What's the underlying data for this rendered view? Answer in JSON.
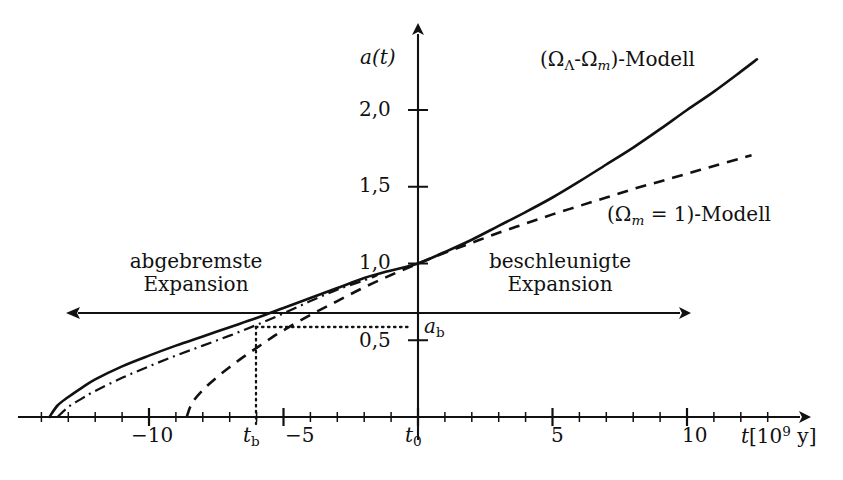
{
  "chart_data": {
    "type": "line",
    "title": "",
    "xlabel": "t[10^9 y]",
    "ylabel": "a(t)",
    "xlim": [
      -14.5,
      13.5
    ],
    "ylim": [
      0,
      2.45
    ],
    "grid": false,
    "legend_position": "inside-right",
    "x_ticks_major": [
      -10,
      -5,
      0,
      5,
      10
    ],
    "x_tick_labels": [
      "-10",
      "-5",
      "t_0",
      "5",
      "10"
    ],
    "x_ticks_minor": [
      -14,
      -13,
      -12,
      -11,
      -9,
      -8,
      -7,
      -6,
      -4,
      -3,
      -2,
      -1,
      1,
      2,
      3,
      4,
      6,
      7,
      8,
      9,
      11,
      12,
      13
    ],
    "y_ticks": [
      0.5,
      1.0,
      1.5,
      2.0
    ],
    "y_tick_labels": [
      "0,5",
      "1,0",
      "1,5",
      "2,0"
    ],
    "series": [
      {
        "name": "(Ω_Λ-Ω_m)-Modell",
        "style": "solid",
        "points": [
          [
            -13.7,
            0.0
          ],
          [
            -13.4,
            0.075
          ],
          [
            -13.0,
            0.13
          ],
          [
            -12.5,
            0.19
          ],
          [
            -12.0,
            0.245
          ],
          [
            -11.0,
            0.33
          ],
          [
            -10.0,
            0.4
          ],
          [
            -9.0,
            0.465
          ],
          [
            -8.0,
            0.525
          ],
          [
            -7.0,
            0.585
          ],
          [
            -6.0,
            0.645
          ],
          [
            -5.0,
            0.71
          ],
          [
            -4.0,
            0.775
          ],
          [
            -3.0,
            0.84
          ],
          [
            -2.0,
            0.905
          ],
          [
            -1.0,
            0.955
          ],
          [
            0.0,
            1.0
          ],
          [
            1.0,
            1.075
          ],
          [
            2.0,
            1.155
          ],
          [
            3.0,
            1.245
          ],
          [
            4.0,
            1.335
          ],
          [
            5.0,
            1.43
          ],
          [
            6.0,
            1.535
          ],
          [
            7.0,
            1.645
          ],
          [
            8.0,
            1.755
          ],
          [
            9.0,
            1.875
          ],
          [
            10.0,
            2.0
          ],
          [
            11.0,
            2.12
          ],
          [
            12.0,
            2.25
          ],
          [
            12.6,
            2.33
          ]
        ]
      },
      {
        "name": "(Ω_m = 1)-Modell",
        "style": "dashed",
        "points": [
          [
            -8.6,
            0.0
          ],
          [
            -8.4,
            0.09
          ],
          [
            -8.0,
            0.175
          ],
          [
            -7.5,
            0.255
          ],
          [
            -7.0,
            0.325
          ],
          [
            -6.5,
            0.39
          ],
          [
            -6.0,
            0.45
          ],
          [
            -5.5,
            0.51
          ],
          [
            -5.0,
            0.565
          ],
          [
            -4.0,
            0.665
          ],
          [
            -3.0,
            0.755
          ],
          [
            -2.0,
            0.845
          ],
          [
            -1.0,
            0.925
          ],
          [
            0.0,
            1.0
          ],
          [
            1.0,
            1.07
          ],
          [
            2.0,
            1.135
          ],
          [
            3.0,
            1.2
          ],
          [
            4.0,
            1.26
          ],
          [
            5.0,
            1.32
          ],
          [
            6.0,
            1.375
          ],
          [
            7.0,
            1.43
          ],
          [
            8.0,
            1.485
          ],
          [
            9.0,
            1.535
          ],
          [
            10.0,
            1.585
          ],
          [
            11.0,
            1.635
          ],
          [
            12.0,
            1.685
          ],
          [
            12.4,
            1.705
          ]
        ]
      },
      {
        "name": "dash-dot-curve",
        "style": "dashdot",
        "points": [
          [
            -13.4,
            0.0
          ],
          [
            -13.0,
            0.065
          ],
          [
            -12.5,
            0.12
          ],
          [
            -12.0,
            0.17
          ],
          [
            -11.0,
            0.255
          ],
          [
            -10.0,
            0.33
          ],
          [
            -9.0,
            0.4
          ],
          [
            -8.0,
            0.465
          ],
          [
            -7.0,
            0.53
          ],
          [
            -6.0,
            0.6
          ],
          [
            -5.0,
            0.675
          ],
          [
            -4.0,
            0.755
          ],
          [
            -3.0,
            0.83
          ],
          [
            -2.0,
            0.89
          ],
          [
            -1.5,
            0.925
          ]
        ]
      }
    ],
    "annotations": {
      "a_b_value": 0.58,
      "t_b_value": -6.4,
      "divider_axis_value": 0.68
    }
  },
  "labels": {
    "y_axis_title": "a(t)",
    "x_axis_title_var": "t",
    "x_axis_title_bracket_open": "[10",
    "x_axis_title_exp": "9",
    "x_axis_title_unit": " y]",
    "y_tick_2_0": "2,0",
    "y_tick_1_5": "1,5",
    "y_tick_1_0": "1,0",
    "y_tick_0_5": "0,5",
    "x_tick_minus10": "−10",
    "x_tick_minus5": "−5",
    "x_tick_tb_var": "t",
    "x_tick_tb_sub": "b",
    "x_tick_t0_var": "t",
    "x_tick_t0_sub": "0",
    "x_tick_5": "5",
    "x_tick_10": "10",
    "a_b_var": "a",
    "a_b_sub": "b",
    "legend_lambda_open": "(Ω",
    "legend_lambda_sub": "Λ",
    "legend_lambda_dash": "-Ω",
    "legend_lambda_sub2": "m",
    "legend_lambda_close": ")-Modell",
    "legend_m1_open": "(Ω",
    "legend_m1_sub": "m",
    "legend_m1_eq": " = 1)-Modell",
    "region_left_line1": "abgebremste",
    "region_left_line2": "Expansion",
    "region_right_line1": "beschleunigte",
    "region_right_line2": "Expansion"
  },
  "colors": {
    "ink": "#111111",
    "background": "#ffffff"
  }
}
